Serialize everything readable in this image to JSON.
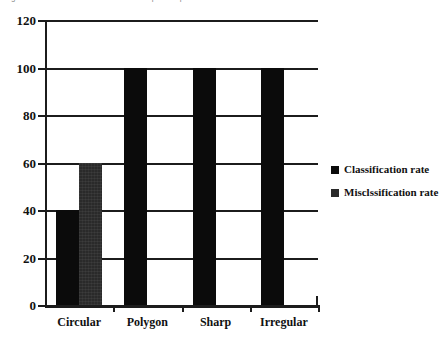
{
  "clipped_caption": "Figure: classification / misclassification per shape",
  "chart_data": {
    "type": "bar",
    "title": "",
    "xlabel": "",
    "ylabel": "",
    "categories": [
      "Circular",
      "Polygon",
      "Sharp",
      "Irregular"
    ],
    "series": [
      {
        "name": "Classification rate",
        "values": [
          40,
          100,
          100,
          100
        ],
        "color": "#0b0b0b"
      },
      {
        "name": "Misclssification rate",
        "values": [
          60,
          0,
          0,
          0
        ],
        "color": "#2a2a2a"
      }
    ],
    "ylim": [
      0,
      120
    ],
    "yticks": [
      0,
      20,
      40,
      60,
      80,
      100,
      120
    ],
    "ytick_labels": [
      "0",
      "20",
      "40",
      "60",
      "80",
      "100",
      "120"
    ],
    "grid": true,
    "grid_axis": "y",
    "legend_position": "right",
    "legend": [
      "Classification rate",
      "Misclssification rate"
    ]
  }
}
